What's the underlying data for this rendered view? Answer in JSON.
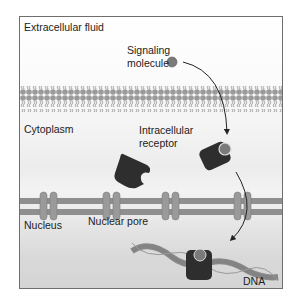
{
  "labels": {
    "extracellular": "Extracellular fluid",
    "signaling_line1": "Signaling",
    "signaling_line2": "molecule",
    "cytoplasm": "Cytoplasm",
    "receptor_line1": "Intracellular",
    "receptor_line2": "receptor",
    "nucleus": "Nucleus",
    "nuclear_pore": "Nuclear pore",
    "dna": "DNA"
  },
  "colors": {
    "membrane": "#9a9a9a",
    "receptor": "#2e2e2e",
    "ligand": "#7a7a7a",
    "pore": "#8f8f8f",
    "border": "#6e6e6e"
  }
}
